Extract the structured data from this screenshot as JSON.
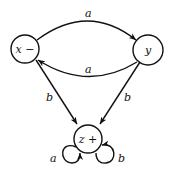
{
  "diagram": {
    "type": "finite-automaton",
    "nodes": [
      {
        "id": "x",
        "label": "x −",
        "start": true,
        "final": false
      },
      {
        "id": "y",
        "label": "y",
        "start": false,
        "final": false
      },
      {
        "id": "z",
        "label": "z +",
        "start": false,
        "final": true
      }
    ],
    "edges": [
      {
        "from": "x",
        "to": "y",
        "label": "a"
      },
      {
        "from": "y",
        "to": "x",
        "label": "a"
      },
      {
        "from": "x",
        "to": "z",
        "label": "b"
      },
      {
        "from": "y",
        "to": "z",
        "label": "b"
      },
      {
        "from": "z",
        "to": "z",
        "label": "a",
        "position": "left-loop"
      },
      {
        "from": "z",
        "to": "z",
        "label": "b",
        "position": "right-loop"
      }
    ]
  }
}
